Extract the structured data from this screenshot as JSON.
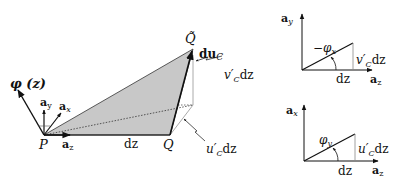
{
  "main_figure": {
    "points": {
      "P": "P",
      "Q": "Q",
      "Q_tilde": "Q̃"
    },
    "vectors": {
      "phi": "φ (z)",
      "ay": "a",
      "ay_sub": "y",
      "ax": "a",
      "ax_sub": "x",
      "az": "a",
      "az_sub": "z",
      "du": "du",
      "du_sub": "C"
    },
    "segment_label": "dz",
    "v_label": "v′",
    "v_sub": "C",
    "v_tail": "dz",
    "u_label": "u′",
    "u_sub": "C",
    "u_tail": "dz"
  },
  "top_right_figure": {
    "vertical_axis": "a",
    "vertical_sub": "y",
    "horizontal_axis": "a",
    "horizontal_sub": "z",
    "angle_label": "−φ",
    "angle_sub": "x",
    "side_label": "v′",
    "side_sub": "C",
    "side_tail": "dz",
    "base_label": "dz"
  },
  "bottom_right_figure": {
    "vertical_axis": "a",
    "vertical_sub": "x",
    "horizontal_axis": "a",
    "horizontal_sub": "z",
    "angle_label": "φ",
    "angle_sub": "y",
    "side_label": "u′",
    "side_sub": "C",
    "side_tail": "dz",
    "base_label": "dz"
  },
  "colors": {
    "fill": "#c8c8c8",
    "line": "#111111",
    "light_line": "#bbbbbb"
  }
}
